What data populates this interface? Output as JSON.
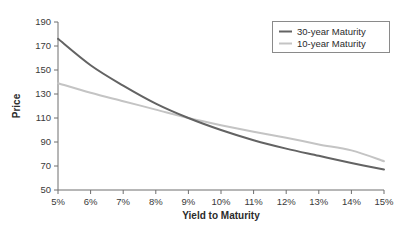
{
  "chart_data": {
    "type": "line",
    "title": "",
    "xlabel": "Yield to Maturity",
    "ylabel": "Price",
    "xlim": [
      5,
      15
    ],
    "ylim": [
      50,
      190
    ],
    "grid": false,
    "legend_position": "top-right",
    "x_tick_labels": [
      "5%",
      "6%",
      "7%",
      "8%",
      "9%",
      "10%",
      "11%",
      "12%",
      "13%",
      "14%",
      "15%"
    ],
    "y_tick_labels": [
      "50",
      "70",
      "90",
      "110",
      "130",
      "150",
      "170",
      "190"
    ],
    "x": [
      5,
      6,
      7,
      8,
      9,
      10,
      11,
      12,
      13,
      14,
      15
    ],
    "series": [
      {
        "name": "30-year Maturity",
        "color": "#636363",
        "values": [
          176,
          154,
          137,
          122,
          110,
          100,
          91.5,
          84.5,
          78.5,
          72.5,
          67
        ]
      },
      {
        "name": "10-year Maturity",
        "color": "#c4c4c4",
        "values": [
          139,
          131,
          124,
          117,
          110,
          104,
          98.5,
          93.5,
          88,
          83,
          74
        ]
      }
    ]
  },
  "axes": {
    "y_title": "Price",
    "x_title": "Yield to Maturity"
  },
  "legend": {
    "entries": [
      {
        "label": "30-year Maturity",
        "color": "#636363"
      },
      {
        "label": "10-year Maturity",
        "color": "#c4c4c4"
      }
    ]
  }
}
